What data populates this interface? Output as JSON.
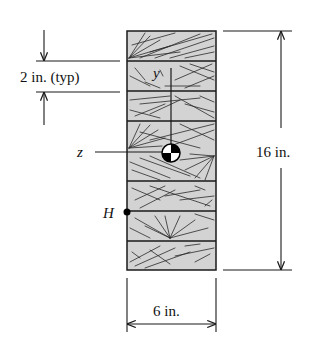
{
  "figure": {
    "type": "cross-section",
    "board_count": 8,
    "colors": {
      "wood_fill": "#d3d3d3",
      "outline": "#1a1a1a",
      "background": "#ffffff"
    }
  },
  "dimensions": {
    "board_thickness": {
      "label": "2 in. (typ)",
      "value": 2,
      "unit": "in."
    },
    "total_height": {
      "label": "16 in.",
      "value": 16,
      "unit": "in."
    },
    "width": {
      "label": "6 in.",
      "value": 6,
      "unit": "in."
    }
  },
  "axes": {
    "y": {
      "label": "y"
    },
    "z": {
      "label": "z"
    }
  },
  "points": {
    "centroid": {
      "label": "",
      "symbol": "centroid-symbol"
    },
    "H": {
      "label": "H"
    }
  }
}
